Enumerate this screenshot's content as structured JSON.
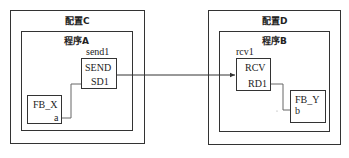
{
  "configurations": [
    {
      "title": "配置C",
      "program": {
        "title": "程序A",
        "blocks": [
          {
            "instance": "send1",
            "type": "SEND",
            "port": "SD1"
          },
          {
            "type": "FB_X",
            "port": "a"
          }
        ]
      }
    },
    {
      "title": "配置D",
      "program": {
        "title": "程序B",
        "blocks": [
          {
            "instance": "rcv1",
            "type": "RCV",
            "port": "RD1"
          },
          {
            "type": "FB_Y",
            "port": "b"
          }
        ]
      }
    }
  ],
  "connections": [
    {
      "from": "FB_X.a",
      "to": "SEND.SD1"
    },
    {
      "from": "SEND",
      "to": "RCV",
      "arrow": true
    },
    {
      "from": "RCV.RD1",
      "to": "FB_Y.b"
    }
  ]
}
